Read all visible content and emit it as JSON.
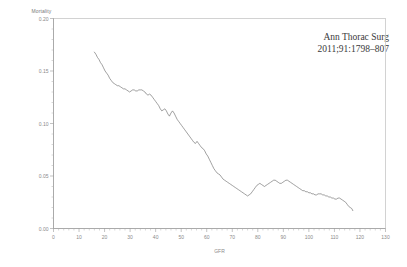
{
  "figure": {
    "ylabel": "Mortality",
    "annotation_line1": "Ann Thorac Surg",
    "annotation_line2": "2011;91:1798–807"
  },
  "chart_data": {
    "type": "line",
    "title": "",
    "subtitle": "",
    "xlabel": "GFR",
    "ylabel": "Mortality",
    "xlim": [
      0,
      130
    ],
    "ylim": [
      0.0,
      0.2
    ],
    "xticks": [
      0,
      10,
      20,
      30,
      40,
      50,
      60,
      70,
      80,
      90,
      100,
      110,
      120,
      130
    ],
    "xticklabels": [
      "0",
      "10",
      "20",
      "30",
      "40",
      "50",
      "60",
      "70",
      "80",
      "90",
      "100",
      "110",
      "120",
      "130"
    ],
    "yticks": [
      0.0,
      0.05,
      0.1,
      0.15,
      0.2
    ],
    "yticklabels": [
      "0.00",
      "0.05",
      "0.10",
      "0.15",
      "0.20"
    ],
    "x_minor_tick_interval": 2,
    "y_minor_tick_interval": 0.01,
    "grid": false,
    "legend": false,
    "annotations": [
      {
        "text": "Ann Thorac Surg",
        "x": 103,
        "y": 0.182
      },
      {
        "text": "2011;91:1798–807",
        "x": 103,
        "y": 0.172
      }
    ],
    "line_color": "#6d6d6d",
    "series": [
      {
        "name": "Mortality vs GFR",
        "x": [
          16.0,
          16.6,
          17.2,
          17.8,
          18.4,
          19.0,
          19.6,
          20.2,
          20.8,
          21.4,
          22.0,
          22.6,
          23.2,
          23.8,
          24.4,
          25.0,
          25.6,
          26.2,
          26.8,
          27.4,
          28.0,
          28.6,
          29.2,
          29.8,
          30.4,
          31.0,
          31.6,
          32.2,
          32.8,
          33.4,
          34.0,
          34.6,
          35.2,
          35.8,
          36.4,
          37.0,
          37.6,
          38.2,
          38.8,
          39.4,
          40.0,
          40.6,
          41.2,
          41.8,
          42.4,
          43.0,
          43.6,
          44.2,
          44.8,
          45.4,
          46.0,
          46.6,
          47.2,
          47.8,
          48.4,
          49.0,
          49.6,
          50.2,
          50.8,
          51.4,
          52.0,
          52.6,
          53.2,
          53.8,
          54.4,
          55.0,
          55.6,
          56.2,
          56.8,
          57.4,
          58.0,
          58.6,
          59.2,
          59.8,
          60.4,
          61.0,
          61.6,
          62.2,
          62.8,
          63.4,
          64.0,
          64.6,
          65.2,
          65.8,
          66.4,
          67.0,
          67.6,
          68.2,
          68.8,
          69.4,
          70.0,
          70.6,
          71.2,
          71.8,
          72.4,
          73.0,
          73.6,
          74.2,
          74.8,
          75.4,
          76.0,
          76.6,
          77.2,
          77.8,
          78.4,
          79.0,
          79.6,
          80.2,
          80.8,
          81.4,
          82.0,
          82.6,
          83.2,
          83.8,
          84.4,
          85.0,
          85.6,
          86.2,
          86.8,
          87.4,
          88.0,
          88.6,
          89.2,
          89.8,
          90.4,
          91.0,
          91.6,
          92.2,
          92.8,
          93.4,
          94.0,
          94.6,
          95.2,
          95.8,
          96.4,
          97.0,
          97.6,
          98.2,
          98.8,
          99.4,
          100.0,
          100.6,
          101.2,
          101.8,
          102.4,
          103.0,
          103.6,
          104.2,
          104.8,
          105.4,
          106.0,
          106.6,
          107.2,
          107.8,
          108.4,
          109.0,
          109.6,
          110.2,
          110.8,
          111.4,
          112.0,
          112.6,
          113.2,
          113.8,
          114.4,
          115.0,
          115.6,
          116.2,
          116.8,
          117.2
        ],
        "y": [
          0.168,
          0.166,
          0.163,
          0.161,
          0.158,
          0.156,
          0.153,
          0.15,
          0.148,
          0.146,
          0.143,
          0.141,
          0.139,
          0.138,
          0.137,
          0.136,
          0.136,
          0.135,
          0.134,
          0.133,
          0.133,
          0.132,
          0.131,
          0.13,
          0.131,
          0.132,
          0.132,
          0.131,
          0.131,
          0.132,
          0.132,
          0.132,
          0.131,
          0.13,
          0.128,
          0.127,
          0.128,
          0.127,
          0.125,
          0.123,
          0.121,
          0.119,
          0.117,
          0.114,
          0.112,
          0.113,
          0.114,
          0.112,
          0.109,
          0.107,
          0.11,
          0.112,
          0.11,
          0.107,
          0.104,
          0.102,
          0.1,
          0.098,
          0.096,
          0.094,
          0.092,
          0.09,
          0.088,
          0.086,
          0.084,
          0.082,
          0.081,
          0.083,
          0.081,
          0.079,
          0.077,
          0.076,
          0.074,
          0.071,
          0.069,
          0.066,
          0.063,
          0.06,
          0.057,
          0.055,
          0.053,
          0.052,
          0.051,
          0.049,
          0.047,
          0.046,
          0.045,
          0.044,
          0.043,
          0.042,
          0.041,
          0.04,
          0.039,
          0.038,
          0.037,
          0.036,
          0.035,
          0.034,
          0.033,
          0.032,
          0.031,
          0.032,
          0.033,
          0.035,
          0.037,
          0.039,
          0.041,
          0.042,
          0.043,
          0.042,
          0.041,
          0.04,
          0.041,
          0.042,
          0.043,
          0.044,
          0.045,
          0.046,
          0.046,
          0.045,
          0.044,
          0.043,
          0.043,
          0.044,
          0.045,
          0.046,
          0.046,
          0.045,
          0.044,
          0.043,
          0.042,
          0.041,
          0.04,
          0.039,
          0.038,
          0.037,
          0.036,
          0.036,
          0.035,
          0.035,
          0.034,
          0.034,
          0.033,
          0.033,
          0.032,
          0.032,
          0.033,
          0.033,
          0.033,
          0.032,
          0.032,
          0.031,
          0.031,
          0.03,
          0.03,
          0.029,
          0.029,
          0.028,
          0.028,
          0.029,
          0.029,
          0.028,
          0.027,
          0.026,
          0.025,
          0.023,
          0.021,
          0.02,
          0.019,
          0.017
        ]
      }
    ]
  }
}
